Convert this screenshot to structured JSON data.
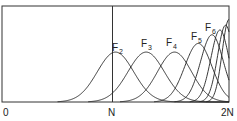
{
  "chart_data": {
    "type": "line",
    "title": "",
    "xlabel": "",
    "ylabel": "",
    "x_ticks": [
      {
        "label": "0",
        "value": 0
      },
      {
        "label": "N",
        "value": 1
      },
      {
        "label": "2N",
        "value": 2
      }
    ],
    "xlim": [
      0,
      2
    ],
    "grid": false,
    "vertical_reference_line_at": "N",
    "series": [
      {
        "name": "F2",
        "peak_x": 1.0,
        "peak_height": 0.52,
        "width": 0.16,
        "labeled": true
      },
      {
        "name": "F3",
        "peak_x": 1.27,
        "peak_height": 0.52,
        "width": 0.16,
        "labeled": true
      },
      {
        "name": "F4",
        "peak_x": 1.52,
        "peak_height": 0.52,
        "width": 0.15,
        "labeled": true
      },
      {
        "name": "F5",
        "peak_x": 1.73,
        "peak_height": 0.61,
        "width": 0.12,
        "labeled": true
      },
      {
        "name": "F6",
        "peak_x": 1.85,
        "peak_height": 0.7,
        "width": 0.1,
        "labeled": true
      },
      {
        "name": "F7",
        "peak_x": 1.92,
        "peak_height": 0.75,
        "width": 0.08,
        "labeled": false
      },
      {
        "name": "F8",
        "peak_x": 1.97,
        "peak_height": 0.8,
        "width": 0.07,
        "labeled": false
      },
      {
        "name": "F9",
        "peak_x": 2.0,
        "peak_height": 0.86,
        "width": 0.06,
        "labeled": false
      }
    ]
  },
  "labels": {
    "x0": "0",
    "xN": "N",
    "x2N": "2N",
    "f2": "F",
    "f2_sub": "2",
    "f3": "F",
    "f3_sub": "3",
    "f4": "F",
    "f4_sub": "4",
    "f5": "F",
    "f5_sub": "5",
    "f6": "F",
    "f6_sub": "6"
  },
  "colors": {
    "line": "#222222",
    "background": "#ffffff"
  }
}
